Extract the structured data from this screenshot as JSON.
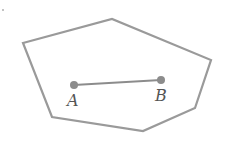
{
  "diagram": {
    "colors": {
      "stroke": "#9a9a9a",
      "point": "#8c8c8c",
      "label": "#555555"
    },
    "polygon": [
      [
        23,
        43
      ],
      [
        112,
        19
      ],
      [
        211,
        60
      ],
      [
        195,
        108
      ],
      [
        143,
        131
      ],
      [
        52,
        117
      ]
    ],
    "points": [
      {
        "name": "A",
        "x": 74,
        "y": 85,
        "label_x": 68,
        "label_y": 106
      },
      {
        "name": "B",
        "x": 161,
        "y": 80,
        "label_x": 155,
        "label_y": 101
      }
    ],
    "segment": {
      "from": "A",
      "to": "B"
    },
    "stray_dot": {
      "x": 3,
      "y": 10
    }
  }
}
